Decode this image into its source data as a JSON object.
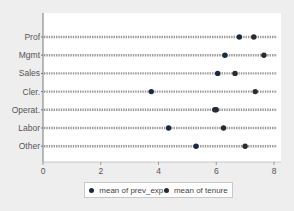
{
  "chart_data": {
    "type": "dot",
    "title": "",
    "xlabel": "",
    "ylabel": "",
    "xlim": [
      0,
      8.2
    ],
    "x_ticks": [
      0,
      2,
      4,
      6,
      8
    ],
    "x_tick_labels": [
      "0",
      "2",
      "4",
      "6",
      "8"
    ],
    "categories": [
      "Prof",
      "Mgmt",
      "Sales",
      "Cler.",
      "Operat.",
      "Labor",
      "Other"
    ],
    "series": [
      {
        "name": "mean of prev_exp",
        "color": "#1a2a45",
        "values": [
          6.8,
          6.3,
          6.05,
          3.75,
          6.0,
          4.35,
          5.3
        ]
      },
      {
        "name": "mean of tenure",
        "color": "#2b2b2b",
        "values": [
          7.3,
          7.65,
          6.65,
          7.35,
          5.95,
          6.25,
          7.0
        ]
      }
    ],
    "grid": false,
    "legend_position": "bottom"
  },
  "legend": {
    "items": [
      {
        "label": "mean of prev_exp",
        "color": "#1a2a45"
      },
      {
        "label": "mean of tenure",
        "color": "#2b2b2b"
      }
    ]
  }
}
